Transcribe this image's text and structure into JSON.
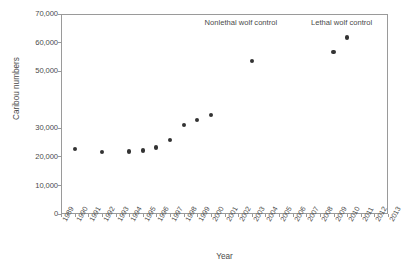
{
  "chart_data": {
    "type": "scatter",
    "title": "",
    "xlabel": "Year",
    "ylabel": "Caribou numbers",
    "xlim": [
      1989,
      2013
    ],
    "ylim": [
      0,
      70000
    ],
    "grid": false,
    "legend": "none",
    "marker": "filled-circle",
    "marker_color": "#333333",
    "x_tick_labels": [
      "1989",
      "1990",
      "1991",
      "1992",
      "1993",
      "1994",
      "1995",
      "1996",
      "1997",
      "1998",
      "1999",
      "2000",
      "2001",
      "2002",
      "2003",
      "2004",
      "2005",
      "2006",
      "2007",
      "2008",
      "2009",
      "2010",
      "2011",
      "2012",
      "2013"
    ],
    "y_tick_labels": [
      "0",
      "10,000",
      "20,000",
      "30,000",
      "50,000",
      "60,000",
      "70,000"
    ],
    "y_tick_values": [
      0,
      10000,
      20000,
      30000,
      50000,
      60000,
      70000
    ],
    "y_missing_tick_note": "40,000 tick and label not rendered in source figure",
    "x": [
      1990,
      1992,
      1994,
      1995,
      1996,
      1997,
      1998,
      1999,
      2000,
      2003,
      2009,
      2010
    ],
    "values": [
      22700,
      21800,
      21900,
      22200,
      23300,
      25800,
      31200,
      33000,
      34700,
      53600,
      56800,
      61800
    ],
    "points": [
      {
        "year": 1990,
        "value": 22700
      },
      {
        "year": 1992,
        "value": 21800
      },
      {
        "year": 1994,
        "value": 21900
      },
      {
        "year": 1995,
        "value": 22200
      },
      {
        "year": 1996,
        "value": 23300
      },
      {
        "year": 1997,
        "value": 25800
      },
      {
        "year": 1998,
        "value": 31200
      },
      {
        "year": 1999,
        "value": 33000
      },
      {
        "year": 2000,
        "value": 34700
      },
      {
        "year": 2003,
        "value": 53600
      },
      {
        "year": 2009,
        "value": 56800
      },
      {
        "year": 2010,
        "value": 61800
      }
    ],
    "annotations": [
      {
        "text": "Nonlethal wolf control",
        "x": 2002.2,
        "y": 68200,
        "align": "center"
      },
      {
        "text": "Lethal wolf control",
        "x": 2009.6,
        "y": 68200,
        "align": "center"
      }
    ]
  },
  "colors": {
    "marker": "#333333",
    "axis": "#9a9a9a",
    "text": "#4a4a4a",
    "background": "#ffffff"
  }
}
